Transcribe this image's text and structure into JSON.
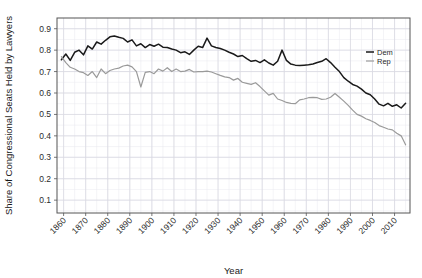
{
  "chart_data": {
    "type": "line",
    "title": "",
    "xlabel": "Year",
    "ylabel": "Share of Congressional Seats Held by Lawyers",
    "xlim": [
      1857,
      2017
    ],
    "ylim": [
      0.04,
      0.95
    ],
    "grid": true,
    "grid_color": "#e8e8ee",
    "panel_border_color": "#555555",
    "legend_position": "top-right-inside",
    "xticks": [
      1860,
      1870,
      1880,
      1890,
      1900,
      1910,
      1920,
      1930,
      1940,
      1950,
      1960,
      1970,
      1980,
      1990,
      2000,
      2010
    ],
    "xtick_labels": [
      "1860",
      "1870",
      "1880",
      "1890",
      "1900",
      "1910",
      "1920",
      "1930",
      "1940",
      "1950",
      "1960",
      "1970",
      "1980",
      "1990",
      "2000",
      "2010"
    ],
    "yticks": [
      0.1,
      0.2,
      0.3,
      0.4,
      0.5,
      0.6,
      0.7,
      0.8,
      0.9
    ],
    "ytick_labels": [
      "0.1",
      "0.2",
      "0.3",
      "0.4",
      "0.5",
      "0.6",
      "0.7",
      "0.8",
      "0.9"
    ],
    "x": [
      1859,
      1861,
      1863,
      1865,
      1867,
      1869,
      1871,
      1873,
      1875,
      1877,
      1879,
      1881,
      1883,
      1885,
      1887,
      1889,
      1891,
      1893,
      1895,
      1897,
      1899,
      1901,
      1903,
      1905,
      1907,
      1909,
      1911,
      1913,
      1915,
      1917,
      1919,
      1921,
      1923,
      1925,
      1927,
      1929,
      1931,
      1933,
      1935,
      1937,
      1939,
      1941,
      1943,
      1945,
      1947,
      1949,
      1951,
      1953,
      1955,
      1957,
      1959,
      1961,
      1963,
      1965,
      1967,
      1969,
      1971,
      1973,
      1975,
      1977,
      1979,
      1981,
      1983,
      1985,
      1987,
      1989,
      1991,
      1993,
      1995,
      1997,
      1999,
      2001,
      2003,
      2005,
      2007,
      2009,
      2011,
      2013,
      2015
    ],
    "series": [
      {
        "name": "Dem",
        "color": "#1a1a1a",
        "width": 1.5,
        "values": [
          0.755,
          0.782,
          0.752,
          0.79,
          0.8,
          0.778,
          0.82,
          0.805,
          0.838,
          0.828,
          0.846,
          0.862,
          0.866,
          0.86,
          0.855,
          0.838,
          0.848,
          0.82,
          0.83,
          0.812,
          0.826,
          0.818,
          0.828,
          0.814,
          0.812,
          0.805,
          0.8,
          0.788,
          0.792,
          0.78,
          0.8,
          0.818,
          0.812,
          0.856,
          0.82,
          0.812,
          0.808,
          0.8,
          0.79,
          0.782,
          0.77,
          0.775,
          0.76,
          0.748,
          0.752,
          0.742,
          0.755,
          0.74,
          0.73,
          0.748,
          0.8,
          0.752,
          0.735,
          0.73,
          0.728,
          0.73,
          0.732,
          0.735,
          0.742,
          0.748,
          0.76,
          0.742,
          0.72,
          0.7,
          0.672,
          0.655,
          0.64,
          0.632,
          0.618,
          0.6,
          0.592,
          0.572,
          0.548,
          0.54,
          0.552,
          0.538,
          0.545,
          0.53,
          0.552
        ]
      },
      {
        "name": "Rep",
        "color": "#9a9a9a",
        "width": 1.2,
        "values": [
          0.77,
          0.742,
          0.72,
          0.712,
          0.7,
          0.695,
          0.682,
          0.7,
          0.672,
          0.712,
          0.69,
          0.705,
          0.712,
          0.716,
          0.726,
          0.73,
          0.722,
          0.7,
          0.628,
          0.696,
          0.7,
          0.69,
          0.712,
          0.702,
          0.718,
          0.7,
          0.712,
          0.7,
          0.702,
          0.71,
          0.698,
          0.7,
          0.7,
          0.702,
          0.698,
          0.69,
          0.682,
          0.675,
          0.672,
          0.66,
          0.668,
          0.65,
          0.645,
          0.64,
          0.648,
          0.63,
          0.61,
          0.59,
          0.598,
          0.572,
          0.565,
          0.556,
          0.552,
          0.55,
          0.568,
          0.572,
          0.578,
          0.58,
          0.578,
          0.57,
          0.572,
          0.58,
          0.598,
          0.58,
          0.562,
          0.542,
          0.52,
          0.5,
          0.492,
          0.48,
          0.472,
          0.462,
          0.448,
          0.44,
          0.432,
          0.428,
          0.412,
          0.4,
          0.358
        ]
      }
    ]
  },
  "legend": {
    "entries": [
      {
        "label": "Dem"
      },
      {
        "label": "Rep"
      }
    ]
  }
}
